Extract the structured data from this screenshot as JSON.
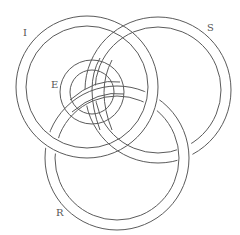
{
  "diagram": {
    "type": "interlaced-rings-knot",
    "labels": {
      "I": "I",
      "S": "S",
      "E": "E",
      "R": "R"
    },
    "stroke_color": "#5a5a5a",
    "background": "#ffffff"
  }
}
